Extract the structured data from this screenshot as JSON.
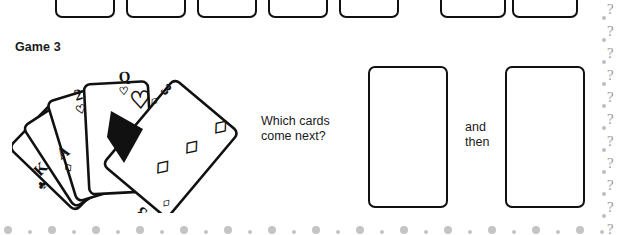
{
  "page": {
    "title": "Game 3",
    "background_color": "#ffffff",
    "ink_color": "#111111"
  },
  "heading": {
    "label": "Game 3"
  },
  "prompt": {
    "question": "Which cards\ncome next?",
    "connector": "and\nthen"
  },
  "top_row": {
    "note": "partially cropped row of upside-down playing cards from previous exercise",
    "cards": [
      {
        "rank": "A",
        "suit": "",
        "suit_symbol": "",
        "pips": 0
      },
      {
        "rank": "5",
        "suit": "hearts",
        "suit_symbol": "♥",
        "pips": 2
      },
      {
        "rank": "3",
        "suit": "hearts",
        "suit_symbol": "♥",
        "pips": 1
      },
      {
        "rank": "",
        "suit": "",
        "suit_symbol": "",
        "pips": 0
      },
      {
        "rank": "5",
        "suit": "hearts",
        "suit_symbol": "♥",
        "pips": 2
      },
      {
        "rank": "6",
        "suit": "hearts",
        "suit_symbol": "♥",
        "pips": 2
      },
      {
        "rank": "",
        "suit": "",
        "suit_symbol": "",
        "pips": 0
      }
    ]
  },
  "fan": {
    "description": "fanned hand of five playing cards, sequence puzzle",
    "cards": [
      {
        "rank": "K",
        "suit": "clubs",
        "suit_symbol": "♣"
      },
      {
        "rank": "A",
        "suit": "diamonds",
        "suit_symbol": "♦"
      },
      {
        "rank": "2",
        "suit": "hearts",
        "suit_symbol": "♥"
      },
      {
        "rank": "Q",
        "suit": "hearts",
        "suit_symbol": "♥"
      },
      {
        "rank": "3",
        "suit": "diamonds",
        "suit_symbol": "♦"
      }
    ]
  },
  "answers": {
    "slots": [
      {
        "label": "",
        "placeholder": ""
      },
      {
        "label": "",
        "placeholder": ""
      }
    ]
  }
}
